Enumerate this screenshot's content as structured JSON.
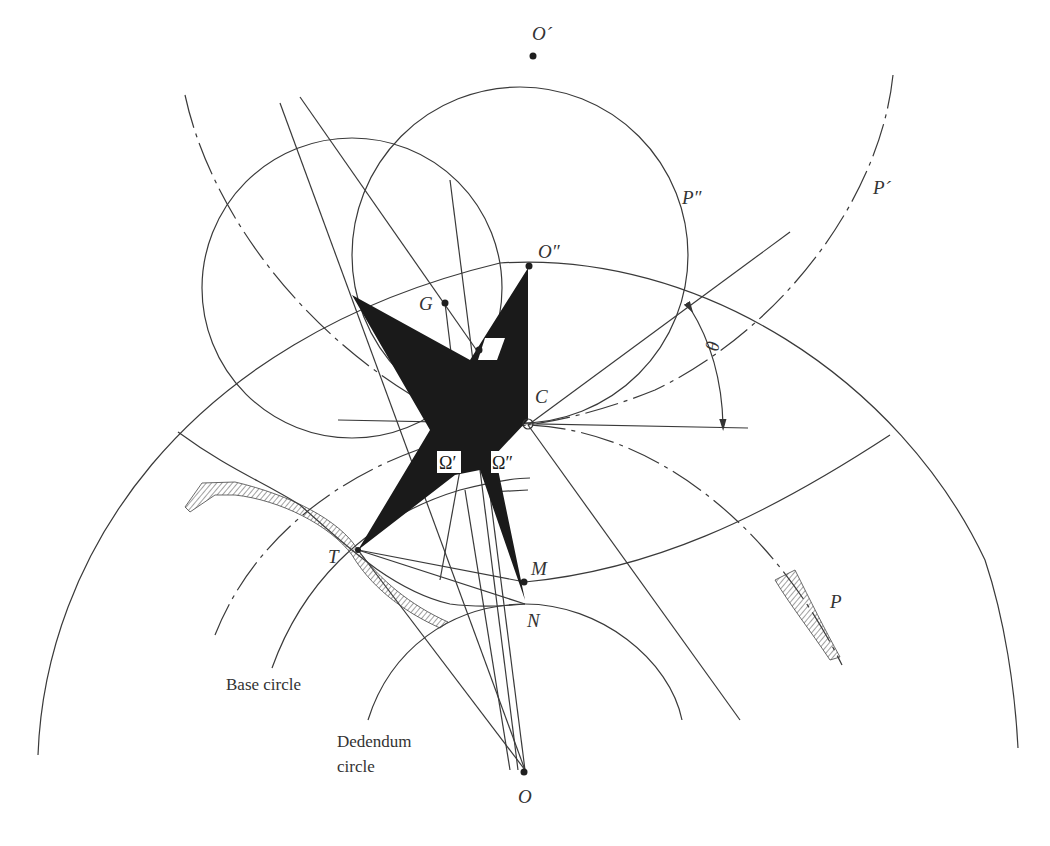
{
  "figure": {
    "points": {
      "O_prime": "O´",
      "O_double_prime": "O″",
      "G": "G",
      "C": "C",
      "T": "T",
      "M": "M",
      "N": "N",
      "O": "O",
      "Omega_prime": "Ω′",
      "Omega_double_prime": "Ω″"
    },
    "curves": {
      "P": "P",
      "P_prime": "P´",
      "P_double_prime": "P″"
    },
    "angle": {
      "theta": "θ"
    },
    "annotations": {
      "base_circle": "Base circle",
      "dedendum_circle_line1": "Dedendum",
      "dedendum_circle_line2": "circle"
    },
    "colors": {
      "line": "#3a3a3a",
      "fill": "#1a1a1a",
      "background": "#ffffff"
    }
  }
}
